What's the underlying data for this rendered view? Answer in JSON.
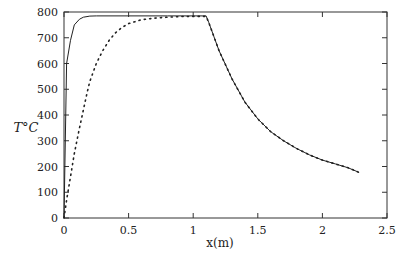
{
  "chart_data": {
    "type": "line",
    "title": "",
    "xlabel": "x(m)",
    "ylabel": "T°C",
    "xlim": [
      0,
      2.5
    ],
    "ylim": [
      0,
      800
    ],
    "xticks": [
      0,
      0.5,
      1,
      1.5,
      2,
      2.5
    ],
    "xtick_labels": [
      "0",
      "0.5",
      "1",
      "1.5",
      "2",
      "2.5"
    ],
    "yticks": [
      0,
      100,
      200,
      300,
      400,
      500,
      600,
      700,
      800
    ],
    "ytick_labels": [
      "0",
      "100",
      "200",
      "300",
      "400",
      "500",
      "600",
      "700",
      "800"
    ],
    "grid": false,
    "legend": null,
    "series": [
      {
        "name": "solid",
        "style": "solid",
        "x": [
          0,
          0.02,
          0.05,
          0.08,
          0.12,
          0.15,
          0.2,
          0.25,
          0.5,
          0.8,
          1.0,
          1.1,
          1.12,
          1.2,
          1.3,
          1.4,
          1.5,
          1.6,
          1.7,
          1.8,
          1.9,
          2.0,
          2.1,
          2.2,
          2.28
        ],
        "y": [
          0,
          600,
          690,
          750,
          772,
          780,
          784,
          785,
          785,
          785,
          785,
          785,
          760,
          650,
          540,
          450,
          385,
          335,
          300,
          270,
          245,
          225,
          210,
          195,
          178
        ]
      },
      {
        "name": "dotted",
        "style": "dotted",
        "x": [
          0,
          0.02,
          0.05,
          0.08,
          0.1,
          0.12,
          0.15,
          0.18,
          0.2,
          0.25,
          0.3,
          0.35,
          0.4,
          0.45,
          0.5,
          0.6,
          0.7,
          0.8,
          0.9,
          1.0,
          1.1,
          1.12,
          1.2,
          1.3,
          1.4,
          1.5,
          1.6,
          1.7,
          1.8,
          1.9,
          2.0,
          2.1,
          2.2,
          2.28
        ],
        "y": [
          0,
          70,
          160,
          250,
          300,
          350,
          420,
          490,
          530,
          600,
          650,
          690,
          720,
          740,
          755,
          770,
          776,
          780,
          782,
          783,
          783,
          760,
          650,
          540,
          450,
          385,
          335,
          300,
          270,
          245,
          225,
          210,
          195,
          178
        ]
      }
    ]
  }
}
